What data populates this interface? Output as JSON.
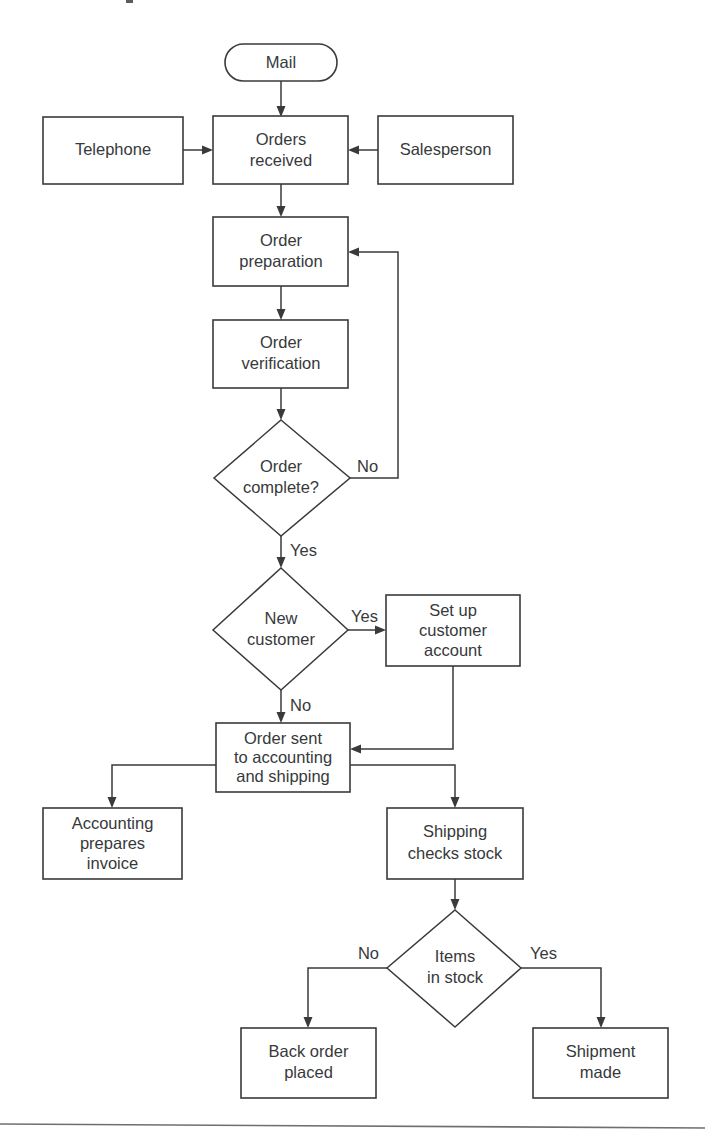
{
  "diagram": {
    "type": "flowchart",
    "colors": {
      "background": "#ffffff",
      "stroke": "#3a3a3a",
      "text": "#37393b",
      "rule": "#6d6f73"
    },
    "nodes": {
      "mail": {
        "label": "Mail",
        "shape": "rounded"
      },
      "telephone": {
        "label": "Telephone",
        "shape": "rectangle"
      },
      "salesperson": {
        "label": "Salesperson",
        "shape": "rectangle"
      },
      "orders_received": {
        "line1": "Orders",
        "line2": "received",
        "shape": "rectangle"
      },
      "order_preparation": {
        "line1": "Order",
        "line2": "preparation",
        "shape": "rectangle"
      },
      "order_verification": {
        "line1": "Order",
        "line2": "verification",
        "shape": "rectangle"
      },
      "order_complete": {
        "line1": "Order",
        "line2": "complete?",
        "shape": "diamond"
      },
      "new_customer": {
        "line1": "New",
        "line2": "customer",
        "shape": "diamond"
      },
      "set_up_account": {
        "line1": "Set up",
        "line2": "customer",
        "line3": "account",
        "shape": "rectangle"
      },
      "order_sent": {
        "line1": "Order sent",
        "line2": "to accounting",
        "line3": "and shipping",
        "shape": "rectangle"
      },
      "accounting_invoice": {
        "line1": "Accounting",
        "line2": "prepares",
        "line3": "invoice",
        "shape": "rectangle"
      },
      "shipping_checks": {
        "line1": "Shipping",
        "line2": "checks stock",
        "shape": "rectangle"
      },
      "items_in_stock": {
        "line1": "Items",
        "line2": "in stock",
        "shape": "diamond"
      },
      "back_order": {
        "line1": "Back order",
        "line2": "placed",
        "shape": "rectangle"
      },
      "shipment_made": {
        "line1": "Shipment",
        "line2": "made",
        "shape": "rectangle"
      }
    },
    "edge_labels": {
      "order_complete_no": "No",
      "order_complete_yes": "Yes",
      "new_customer_yes": "Yes",
      "new_customer_no": "No",
      "items_in_stock_no": "No",
      "items_in_stock_yes": "Yes"
    }
  }
}
